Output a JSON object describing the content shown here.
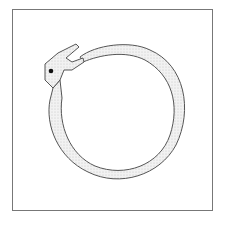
{
  "figure": {
    "colors": {
      "outline": "#555555",
      "body_fill": "#e8e8e8",
      "frame": "#777777",
      "eye": "#111111",
      "background": "#ffffff"
    }
  }
}
